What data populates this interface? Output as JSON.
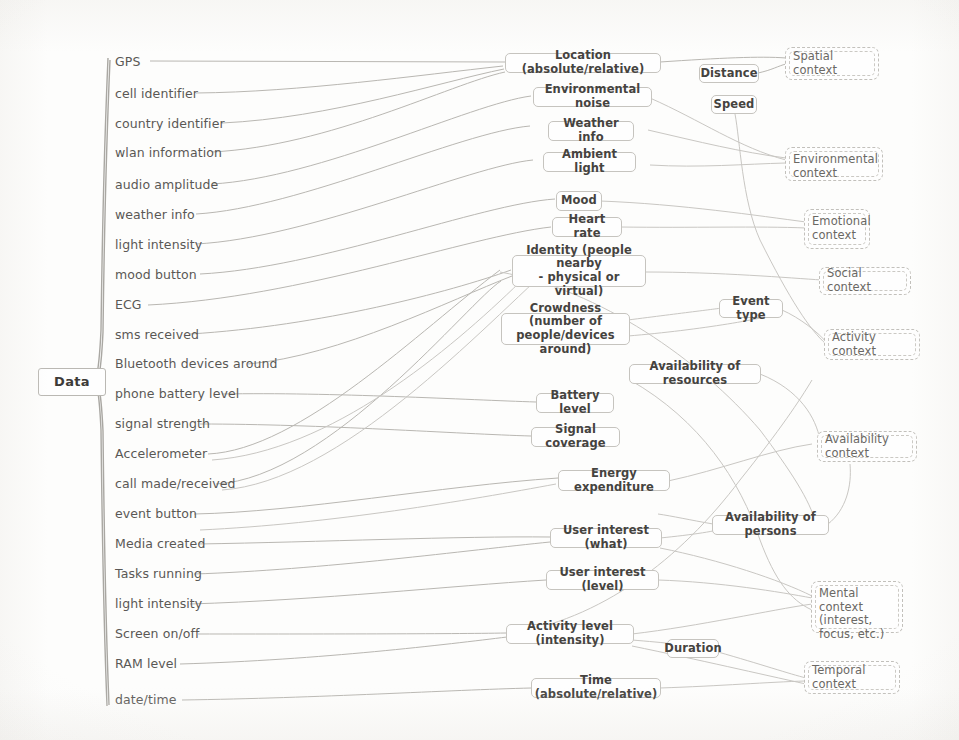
{
  "diagram": {
    "root": {
      "label": "Data"
    },
    "colors": {
      "paper": "#fdfdfc",
      "line": "#b9b7b2",
      "box_border": "#c6c4bf",
      "context_border": "#c2c0bb",
      "text": "#45433f",
      "context_text": "#6a6864"
    },
    "sources": [
      {
        "label": "GPS"
      },
      {
        "label": "cell identifier"
      },
      {
        "label": "country identifier"
      },
      {
        "label": "wlan information"
      },
      {
        "label": "audio amplitude"
      },
      {
        "label": "weather info"
      },
      {
        "label": "light intensity"
      },
      {
        "label": "mood button"
      },
      {
        "label": "ECG"
      },
      {
        "label": "sms received"
      },
      {
        "label": "Bluetooth devices around"
      },
      {
        "label": "phone battery level"
      },
      {
        "label": "signal strength"
      },
      {
        "label": "Accelerometer"
      },
      {
        "label": "call made/received"
      },
      {
        "label": "event button"
      },
      {
        "label": "Media created"
      },
      {
        "label": "Tasks running"
      },
      {
        "label": "light intensity"
      },
      {
        "label": "Screen on/off"
      },
      {
        "label": "RAM level"
      },
      {
        "label": "date/time"
      }
    ],
    "features": [
      {
        "label": "Location (absolute/relative)"
      },
      {
        "label": "Environmental noise"
      },
      {
        "label": "Weather info"
      },
      {
        "label": "Ambient light"
      },
      {
        "label": "Mood"
      },
      {
        "label": "Heart rate"
      },
      {
        "label": "Identity (people nearby\n- physical or virtual)",
        "line1": "Identity (people nearby",
        "line2": "- physical or virtual)"
      },
      {
        "label": "Crowdness (number of\npeople/devices around)",
        "line1": "Crowdness (number of",
        "line2": "people/devices around)"
      },
      {
        "label": "Battery level"
      },
      {
        "label": "Signal coverage"
      },
      {
        "label": "Energy expenditure"
      },
      {
        "label": "User interest (what)"
      },
      {
        "label": "User interest (level)"
      },
      {
        "label": "Activity level (intensity)"
      },
      {
        "label": "Time (absolute/relative)"
      },
      {
        "label": "Distance"
      },
      {
        "label": "Speed"
      },
      {
        "label": "Event type"
      },
      {
        "label": "Availability of resources"
      },
      {
        "label": "Availability of persons"
      },
      {
        "label": "Duration"
      }
    ],
    "contexts": [
      {
        "label": "Spatial context"
      },
      {
        "label": "Environmental context",
        "line1": "Environmental",
        "line2": "context"
      },
      {
        "label": "Emotional context",
        "line1": "Emotional",
        "line2": "context"
      },
      {
        "label": "Social context"
      },
      {
        "label": "Activity context"
      },
      {
        "label": "Availability context"
      },
      {
        "label": "Mental context (interest, focus, etc.)",
        "line1": "Mental context",
        "line2": "(interest,",
        "line3": "focus, etc.)"
      },
      {
        "label": "Temporal context"
      }
    ]
  }
}
